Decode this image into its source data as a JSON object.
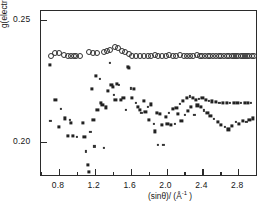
{
  "figure": {
    "background": "#ffffff",
    "frame_color": "#2b2b2b"
  },
  "axes": {
    "x_title_prefix": "(sin",
    "x_title_theta": "θ",
    "x_title_suffix": ")/ (Å",
    "x_title_exp": "-1",
    "x_title_end": " )",
    "y_title_symbol": "g",
    "y_title_rest": "(electrons/Å",
    "y_title_exp": "-1",
    "y_title_end": ")",
    "x_ticks": [
      "0.8",
      "1.2",
      "1.6",
      "2.0",
      "2.4",
      "2.8"
    ],
    "x_tick_values": [
      0.8,
      1.2,
      1.6,
      2.0,
      2.4,
      2.8
    ],
    "x_minor_values": [
      0.6,
      1.0,
      1.4,
      1.8,
      2.2,
      2.6,
      3.0
    ],
    "y_ticks": [
      "0.25",
      "0.20"
    ],
    "y_tick_values": [
      0.25,
      0.2
    ]
  },
  "chart_data": {
    "type": "scatter",
    "title": "",
    "xlabel": "(sinθ)/ (Å⁻¹ )",
    "ylabel": "ḡ(electrons/Å⁻¹)",
    "xlim": [
      0.6,
      3.02
    ],
    "ylim": [
      0.1855,
      0.2535
    ],
    "grid": false,
    "legend": "none",
    "series": [
      {
        "name": "open-circles",
        "marker": "open-circle",
        "color": "#2f2f2f",
        "points": [
          [
            0.715,
            0.2352
          ],
          [
            0.76,
            0.2365
          ],
          [
            0.8,
            0.2365
          ],
          [
            0.86,
            0.2355
          ],
          [
            0.9,
            0.2352
          ],
          [
            0.93,
            0.235
          ],
          [
            0.965,
            0.235
          ],
          [
            0.995,
            0.235
          ],
          [
            1.03,
            0.235
          ],
          [
            1.13,
            0.2367
          ],
          [
            1.175,
            0.2362
          ],
          [
            1.22,
            0.2364
          ],
          [
            1.3,
            0.2368
          ],
          [
            1.335,
            0.2372
          ],
          [
            1.375,
            0.2375
          ],
          [
            1.42,
            0.2386
          ],
          [
            1.455,
            0.2382
          ],
          [
            1.5,
            0.2372
          ],
          [
            1.54,
            0.2366
          ],
          [
            1.58,
            0.2358
          ],
          [
            1.62,
            0.2352
          ],
          [
            1.66,
            0.235
          ],
          [
            1.7,
            0.2352
          ],
          [
            1.745,
            0.2352
          ],
          [
            1.79,
            0.2351
          ],
          [
            1.83,
            0.2352
          ],
          [
            1.87,
            0.2354
          ],
          [
            1.91,
            0.2352
          ],
          [
            1.95,
            0.235
          ],
          [
            1.99,
            0.2352
          ],
          [
            2.03,
            0.2356
          ],
          [
            2.07,
            0.2352
          ],
          [
            2.11,
            0.235
          ],
          [
            2.15,
            0.2354
          ],
          [
            2.19,
            0.2352
          ],
          [
            2.23,
            0.2352
          ],
          [
            2.265,
            0.235
          ],
          [
            2.3,
            0.2352
          ],
          [
            2.335,
            0.2353
          ],
          [
            2.37,
            0.2352
          ],
          [
            2.4,
            0.2351
          ],
          [
            2.43,
            0.2352
          ],
          [
            2.46,
            0.2352
          ],
          [
            2.49,
            0.2352
          ],
          [
            2.52,
            0.2352
          ],
          [
            2.55,
            0.2351
          ],
          [
            2.58,
            0.2352
          ],
          [
            2.61,
            0.2352
          ],
          [
            2.64,
            0.2352
          ],
          [
            2.67,
            0.2352
          ],
          [
            2.7,
            0.2352
          ],
          [
            2.725,
            0.2352
          ],
          [
            2.75,
            0.2352
          ],
          [
            2.775,
            0.2352
          ],
          [
            2.8,
            0.2352
          ],
          [
            2.825,
            0.2352
          ],
          [
            2.85,
            0.2352
          ],
          [
            2.875,
            0.2352
          ],
          [
            2.9,
            0.2352
          ],
          [
            2.925,
            0.2352
          ],
          [
            2.95,
            0.2352
          ],
          [
            2.97,
            0.2352
          ]
        ]
      },
      {
        "name": "dark-crosses",
        "marker": "cross",
        "color": "#222222",
        "points": [
          [
            0.7,
            0.2315
          ],
          [
            0.705,
            0.2085
          ],
          [
            0.76,
            0.2172
          ],
          [
            0.8,
            0.206
          ],
          [
            0.82,
            0.2135
          ],
          [
            0.865,
            0.2095
          ],
          [
            0.9,
            0.2022
          ],
          [
            0.925,
            0.209
          ],
          [
            0.935,
            0.2075
          ],
          [
            0.96,
            0.2022
          ],
          [
            1.0,
            0.2018
          ],
          [
            1.065,
            0.2075
          ],
          [
            1.085,
            0.2018
          ],
          [
            1.105,
            0.196
          ],
          [
            1.12,
            0.1905
          ],
          [
            1.13,
            0.1875
          ],
          [
            1.15,
            0.204
          ],
          [
            1.165,
            0.2215
          ],
          [
            1.185,
            0.209
          ],
          [
            1.195,
            0.198
          ],
          [
            1.215,
            0.227
          ],
          [
            1.23,
            0.213
          ],
          [
            1.255,
            0.2258
          ],
          [
            1.27,
            0.216
          ],
          [
            1.285,
            0.215
          ],
          [
            1.3,
            0.1975
          ],
          [
            1.32,
            0.214
          ],
          [
            1.345,
            0.2208
          ],
          [
            1.365,
            0.2322
          ],
          [
            1.385,
            0.2232
          ],
          [
            1.4,
            0.2225
          ],
          [
            1.415,
            0.219
          ],
          [
            1.43,
            0.2172
          ],
          [
            1.45,
            0.2235
          ],
          [
            1.47,
            0.2232
          ],
          [
            1.495,
            0.217
          ],
          [
            1.52,
            0.2178
          ],
          [
            1.545,
            0.213
          ],
          [
            1.565,
            0.2305
          ],
          [
            1.58,
            0.2302
          ],
          [
            1.6,
            0.2218
          ],
          [
            1.615,
            0.218
          ],
          [
            1.635,
            0.2215
          ],
          [
            1.655,
            0.2158
          ],
          [
            1.68,
            0.2142
          ],
          [
            1.7,
            0.213
          ],
          [
            1.72,
            0.2118
          ],
          [
            1.745,
            0.2168
          ],
          [
            1.765,
            0.2122
          ],
          [
            1.79,
            0.2142
          ],
          [
            1.805,
            0.209
          ],
          [
            1.83,
            0.2152
          ],
          [
            1.855,
            0.2072
          ],
          [
            1.87,
            0.2042
          ],
          [
            1.89,
            0.2118
          ],
          [
            1.905,
            0.1988
          ],
          [
            1.93,
            0.2112
          ],
          [
            1.95,
            0.2068
          ],
          [
            1.965,
            0.1985
          ],
          [
            1.99,
            0.2102
          ],
          [
            2.01,
            0.2072
          ],
          [
            2.03,
            0.2118
          ],
          [
            2.05,
            0.2068
          ],
          [
            2.07,
            0.2135
          ],
          [
            2.09,
            0.2072
          ],
          [
            2.11,
            0.2138
          ],
          [
            2.13,
            0.2112
          ],
          [
            2.15,
            0.2155
          ],
          [
            2.165,
            0.2085
          ],
          [
            2.185,
            0.2168
          ],
          [
            2.205,
            0.2108
          ],
          [
            2.225,
            0.2178
          ],
          [
            2.24,
            0.2125
          ],
          [
            2.26,
            0.2185
          ],
          [
            2.275,
            0.2142
          ],
          [
            2.295,
            0.2178
          ],
          [
            2.31,
            0.2108
          ],
          [
            2.33,
            0.2172
          ],
          [
            2.345,
            0.2148
          ],
          [
            2.365,
            0.2175
          ],
          [
            2.385,
            0.2142
          ],
          [
            2.4,
            0.2178
          ],
          [
            2.42,
            0.2128
          ],
          [
            2.44,
            0.2172
          ],
          [
            2.455,
            0.2118
          ],
          [
            2.475,
            0.2168
          ],
          [
            2.49,
            0.2105
          ],
          [
            2.51,
            0.2165
          ],
          [
            2.53,
            0.2092
          ],
          [
            2.55,
            0.2162
          ],
          [
            2.57,
            0.2082
          ],
          [
            2.59,
            0.216
          ],
          [
            2.61,
            0.207
          ],
          [
            2.63,
            0.2158
          ],
          [
            2.65,
            0.206
          ],
          [
            2.67,
            0.2158
          ],
          [
            2.69,
            0.205
          ],
          [
            2.71,
            0.2158
          ],
          [
            2.73,
            0.2065
          ],
          [
            2.75,
            0.2158
          ],
          [
            2.77,
            0.208
          ],
          [
            2.79,
            0.2158
          ],
          [
            2.81,
            0.2072
          ],
          [
            2.83,
            0.2158
          ],
          [
            2.85,
            0.2085
          ],
          [
            2.87,
            0.2158
          ],
          [
            2.89,
            0.2082
          ],
          [
            2.91,
            0.2158
          ],
          [
            2.925,
            0.209
          ],
          [
            2.945,
            0.2158
          ],
          [
            2.965,
            0.2095
          ]
        ]
      }
    ]
  }
}
